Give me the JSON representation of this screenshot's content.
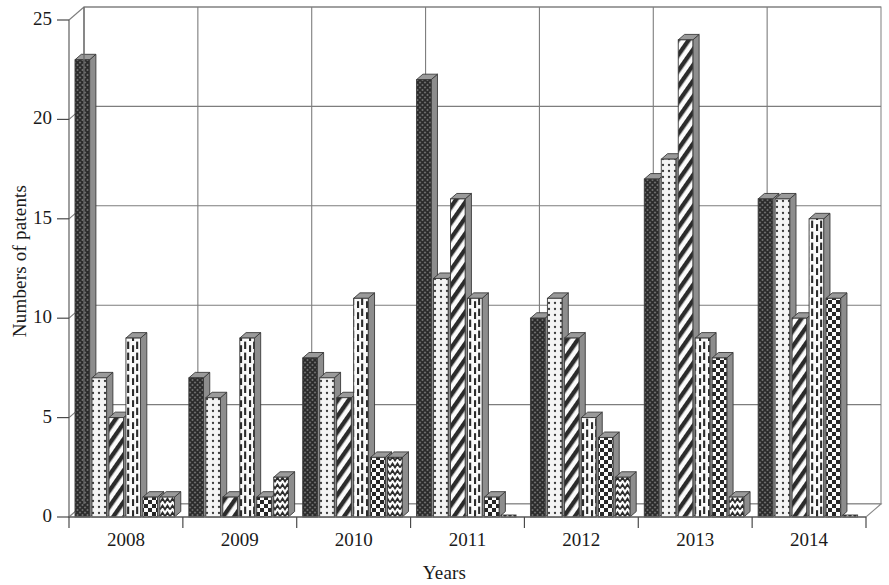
{
  "chart_data": {
    "type": "bar",
    "title": "",
    "xlabel": "Years",
    "ylabel": "Numbers of patents",
    "categories": [
      "2008",
      "2009",
      "2010",
      "2011",
      "2012",
      "2013",
      "2014"
    ],
    "ylim": [
      0,
      25
    ],
    "yticks": [
      0,
      5,
      10,
      15,
      20,
      25
    ],
    "grid": true,
    "legend": "none",
    "series": [
      {
        "name": "series-1-crosshatch-dark",
        "pattern": "crosshatch-dark",
        "values": [
          23,
          7,
          8,
          22,
          10,
          17,
          16
        ]
      },
      {
        "name": "series-2-dotted-light",
        "pattern": "dotted-light",
        "values": [
          7,
          6,
          7,
          12,
          11,
          18,
          16
        ]
      },
      {
        "name": "series-3-diagonal-stripe",
        "pattern": "diagonal-stripe",
        "values": [
          5,
          1,
          6,
          16,
          9,
          24,
          10
        ]
      },
      {
        "name": "series-4-dashed-vertical",
        "pattern": "dashed-vertical",
        "values": [
          9,
          9,
          11,
          11,
          5,
          9,
          15
        ]
      },
      {
        "name": "series-5-checkerboard",
        "pattern": "checkerboard",
        "values": [
          1,
          1,
          3,
          1,
          4,
          8,
          11
        ]
      },
      {
        "name": "series-6-wavy",
        "pattern": "wavy",
        "values": [
          1,
          2,
          3,
          0,
          2,
          1,
          0
        ]
      }
    ]
  },
  "axis": {
    "y_title": "Numbers of patents",
    "x_title": "Years",
    "y_tick_labels": [
      "0",
      "5",
      "10",
      "15",
      "20",
      "25"
    ],
    "x_tick_labels": [
      "2008",
      "2009",
      "2010",
      "2011",
      "2012",
      "2013",
      "2014"
    ]
  },
  "colors": {
    "background": "#ffffff",
    "gridline": "#7d7d7d",
    "axis": "#6b6b6b",
    "bar_outline": "#3a3a3a",
    "bar_dark": "#585858",
    "bar_light": "#f2f2f2",
    "bar_side_shade": "#8d8d8d",
    "text": "#1a1a1a"
  }
}
